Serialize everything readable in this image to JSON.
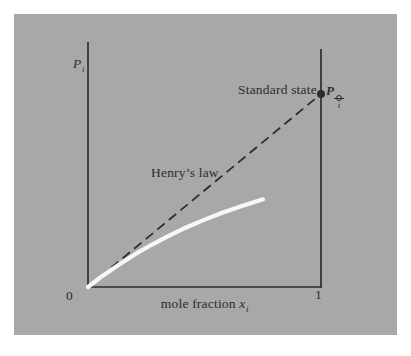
{
  "figure": {
    "page_background": "#ffffff",
    "panel_color": "#a8a8a8",
    "ink_color": "#2d2d2d",
    "curve_color": "#f7f7f7"
  },
  "labels": {
    "y_axis": {
      "symbol": "P",
      "subscript": "i"
    },
    "x_axis": {
      "text": "mole fraction",
      "symbol": "x",
      "subscript": "i"
    },
    "origin": "0",
    "x_max": "1",
    "henrys_law": "Henry’s law",
    "standard_state": "Standard state",
    "standard_point": {
      "symbol": "P",
      "subscript": "i",
      "superscript_symbol": "⦵"
    }
  },
  "chart_data": {
    "type": "line",
    "xlabel": "mole fraction x_i",
    "ylabel": "P_i",
    "xlim": [
      0,
      1
    ],
    "ylim": [
      0,
      1
    ],
    "grid": false,
    "y_scale_note": "y axis unlabeled; values are fractions of plot height",
    "legend_position": "none",
    "series": [
      {
        "name": "Henry's law extrapolation",
        "style": "dashed",
        "color": "#2d2d2d",
        "points": [
          [
            0,
            0
          ],
          [
            1,
            0.788
          ]
        ]
      },
      {
        "name": "actual partial pressure of solute",
        "style": "solid",
        "color": "#f7f7f7",
        "points": [
          [
            0,
            0
          ],
          [
            0.063,
            0.046
          ],
          [
            0.129,
            0.089
          ],
          [
            0.197,
            0.131
          ],
          [
            0.269,
            0.17
          ],
          [
            0.342,
            0.207
          ],
          [
            0.419,
            0.242
          ],
          [
            0.498,
            0.274
          ],
          [
            0.579,
            0.304
          ],
          [
            0.664,
            0.332
          ],
          [
            0.751,
            0.358
          ]
        ]
      }
    ],
    "markers": [
      {
        "name": "Standard state",
        "label": "P_i⦵",
        "x": 1,
        "y": 0.788,
        "marker": "filled-circle"
      }
    ],
    "annotations": [
      {
        "text": "Henry’s law",
        "position": "left of middle of dashed line"
      },
      {
        "text": "Standard state",
        "position": "left of marker at x=1"
      }
    ]
  }
}
